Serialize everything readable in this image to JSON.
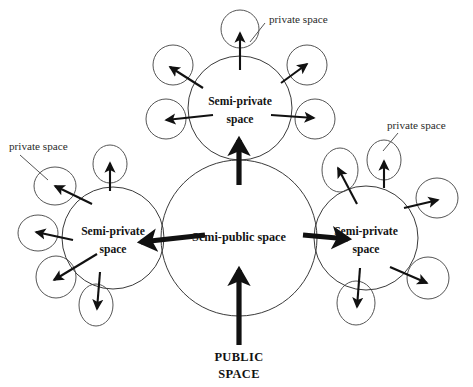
{
  "diagram": {
    "title_text_public": "PUBLIC\nSPACE",
    "public_label_line1": "PUBLIC",
    "public_label_line2": "SPACE",
    "colors": {
      "background": "#ffffff",
      "circle_stroke": "#3a3a3a",
      "satellite_stroke": "#555555",
      "arrow_fill": "#111111",
      "text": "#141414",
      "private_text": "#2b2b2b"
    },
    "zones": {
      "center": {
        "name": "semi-public",
        "label": "Semi-public space",
        "cx": 239,
        "cy": 238,
        "r": 78
      },
      "top": {
        "name": "semi-private-top",
        "label_line1": "Semi-private",
        "label_line2": "space",
        "cx": 240,
        "cy": 108,
        "r": 52
      },
      "left": {
        "name": "semi-private-left",
        "label_line1": "Semi-private",
        "label_line2": "space",
        "cx": 113,
        "cy": 238,
        "r": 51
      },
      "right": {
        "name": "semi-private-right",
        "label_line1": "Semi-private",
        "label_line2": "space",
        "cx": 366,
        "cy": 238,
        "r": 52
      }
    },
    "private_labels": [
      {
        "id": "private-label-top",
        "text": "private space",
        "x": 269,
        "y": 20
      },
      {
        "id": "private-label-left",
        "text": "private space",
        "x": 9,
        "y": 147
      },
      {
        "id": "private-label-right",
        "text": "private space",
        "x": 387,
        "y": 126
      }
    ],
    "satellites": {
      "top": [
        {
          "id": "top-sat-n",
          "cx": 240,
          "cy": 29,
          "rx": 19,
          "ry": 19
        },
        {
          "id": "top-sat-nw",
          "cx": 173,
          "cy": 65,
          "rx": 20,
          "ry": 20
        },
        {
          "id": "top-sat-ne",
          "cx": 307,
          "cy": 65,
          "rx": 20,
          "ry": 20
        },
        {
          "id": "top-sat-w",
          "cx": 166,
          "cy": 119,
          "rx": 20,
          "ry": 20
        },
        {
          "id": "top-sat-e",
          "cx": 315,
          "cy": 119,
          "rx": 20,
          "ry": 20
        }
      ],
      "left": [
        {
          "id": "left-sat-n",
          "cx": 110,
          "cy": 164,
          "rx": 17,
          "ry": 19
        },
        {
          "id": "left-sat-nw",
          "cx": 55,
          "cy": 186,
          "rx": 21,
          "ry": 19
        },
        {
          "id": "left-sat-w",
          "cx": 38,
          "cy": 233,
          "rx": 20,
          "ry": 18
        },
        {
          "id": "left-sat-sw",
          "cx": 56,
          "cy": 277,
          "rx": 20,
          "ry": 21
        },
        {
          "id": "left-sat-s",
          "cx": 96,
          "cy": 305,
          "rx": 17,
          "ry": 21
        }
      ],
      "right": [
        {
          "id": "right-sat-n",
          "cx": 384,
          "cy": 160,
          "rx": 17,
          "ry": 20
        },
        {
          "id": "right-sat-nw",
          "cx": 340,
          "cy": 170,
          "rx": 18,
          "ry": 22
        },
        {
          "id": "right-sat-e",
          "cx": 437,
          "cy": 198,
          "rx": 21,
          "ry": 20
        },
        {
          "id": "right-sat-se",
          "cx": 428,
          "cy": 278,
          "rx": 21,
          "ry": 21
        },
        {
          "id": "right-sat-s",
          "cx": 356,
          "cy": 303,
          "rx": 19,
          "ry": 22
        }
      ]
    },
    "arrows": {
      "thick": [
        {
          "id": "arrow-public-to-center",
          "x1": 239,
          "y1": 345,
          "x2": 239,
          "y2": 270,
          "desc": "public space into semi-public"
        },
        {
          "id": "arrow-center-to-top",
          "x1": 239,
          "y1": 185,
          "x2": 239,
          "y2": 140,
          "desc": "semi-public to top semi-private"
        },
        {
          "id": "arrow-center-to-left",
          "x1": 205,
          "y1": 235,
          "x2": 141,
          "y2": 242,
          "desc": "semi-public to left semi-private"
        },
        {
          "id": "arrow-center-to-right",
          "x1": 303,
          "y1": 235,
          "x2": 348,
          "y2": 239,
          "desc": "semi-public to right semi-private"
        }
      ],
      "thin": [
        {
          "id": "top-arrow-n",
          "x1": 240,
          "y1": 70,
          "x2": 240,
          "y2": 33
        },
        {
          "id": "top-arrow-nw",
          "x1": 203,
          "y1": 88,
          "x2": 170,
          "y2": 67
        },
        {
          "id": "top-arrow-ne",
          "x1": 281,
          "y1": 83,
          "x2": 307,
          "y2": 64
        },
        {
          "id": "top-arrow-w",
          "x1": 213,
          "y1": 115,
          "x2": 166,
          "y2": 120
        },
        {
          "id": "top-arrow-e",
          "x1": 271,
          "y1": 115,
          "x2": 314,
          "y2": 118
        },
        {
          "id": "left-arrow-n",
          "x1": 110,
          "y1": 191,
          "x2": 110,
          "y2": 163
        },
        {
          "id": "left-arrow-nw",
          "x1": 92,
          "y1": 204,
          "x2": 55,
          "y2": 186
        },
        {
          "id": "left-arrow-w",
          "x1": 73,
          "y1": 240,
          "x2": 36,
          "y2": 232
        },
        {
          "id": "left-arrow-sw",
          "x1": 97,
          "y1": 254,
          "x2": 54,
          "y2": 280
        },
        {
          "id": "left-arrow-s",
          "x1": 100,
          "y1": 272,
          "x2": 97,
          "y2": 309
        },
        {
          "id": "right-arrow-n",
          "x1": 384,
          "y1": 188,
          "x2": 384,
          "y2": 161
        },
        {
          "id": "right-arrow-nw",
          "x1": 357,
          "y1": 204,
          "x2": 338,
          "y2": 168
        },
        {
          "id": "right-arrow-e",
          "x1": 404,
          "y1": 208,
          "x2": 438,
          "y2": 200
        },
        {
          "id": "right-arrow-se",
          "x1": 390,
          "y1": 267,
          "x2": 427,
          "y2": 283
        },
        {
          "id": "right-arrow-s",
          "x1": 360,
          "y1": 268,
          "x2": 357,
          "y2": 307
        }
      ],
      "leaders": [
        {
          "id": "leader-top",
          "x1": 265,
          "y1": 23,
          "x2": 250,
          "y2": 42
        },
        {
          "id": "leader-left",
          "x1": 20,
          "y1": 155,
          "x2": 48,
          "y2": 180
        },
        {
          "id": "leader-right",
          "x1": 398,
          "y1": 133,
          "x2": 383,
          "y2": 151
        }
      ]
    },
    "public_label": {
      "x": 239,
      "y": 358
    }
  }
}
